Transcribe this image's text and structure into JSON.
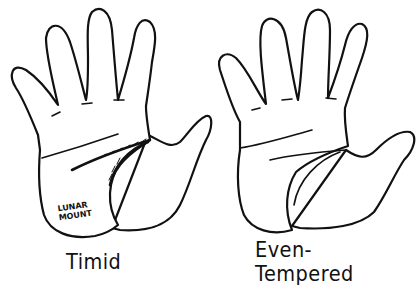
{
  "figure": {
    "left_hand": {
      "caption": "Timid",
      "annotation_line1": "LUNAR",
      "annotation_line2": "MOUNT"
    },
    "right_hand": {
      "caption": "Even-Tempered"
    }
  },
  "colors": {
    "ink": "#111111",
    "background": "#ffffff"
  }
}
